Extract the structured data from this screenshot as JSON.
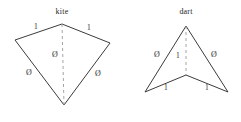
{
  "figure": {
    "background_color": "#ffffff",
    "stroke_color": "#3b3b3b",
    "dash_color": "#9a9a9a",
    "text_color": "#2e2e2e",
    "width": 241,
    "height": 122
  },
  "shapes": [
    {
      "id": "kite",
      "title": "kite",
      "title_pos": {
        "x": 62,
        "y": 12
      },
      "outline_points": "62,24 15,40 64,105 110,43",
      "axis_points": "62,24 64,105",
      "edge_labels": [
        {
          "text": "1",
          "x": 36,
          "y": 27
        },
        {
          "text": "1",
          "x": 89,
          "y": 28
        },
        {
          "text": "Ø",
          "x": 29,
          "y": 73
        },
        {
          "text": "Ø",
          "x": 98,
          "y": 74
        }
      ],
      "axis_labels": [
        {
          "text": "Ø",
          "x": 55,
          "y": 55
        }
      ]
    },
    {
      "id": "dart",
      "title": "dart",
      "title_pos": {
        "x": 186,
        "y": 12
      },
      "outline_points": "186,26 145,92 186,75 228,92",
      "axis_points": "186,26 186,75",
      "edge_labels": [
        {
          "text": "Ø",
          "x": 157,
          "y": 55
        },
        {
          "text": "Ø",
          "x": 214,
          "y": 55
        },
        {
          "text": "1",
          "x": 166,
          "y": 88
        },
        {
          "text": "1",
          "x": 207,
          "y": 88
        }
      ],
      "axis_labels": [
        {
          "text": "1",
          "x": 178,
          "y": 56
        }
      ]
    }
  ]
}
